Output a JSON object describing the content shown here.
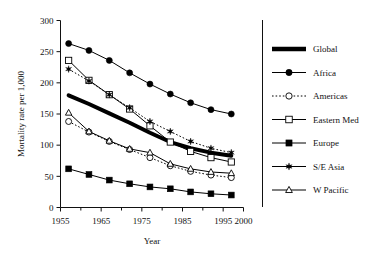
{
  "chart_data": {
    "type": "line",
    "title": "",
    "xlabel": "Year",
    "ylabel": "Mortality rate per 1,000",
    "xlim": [
      1955,
      2000
    ],
    "ylim": [
      0,
      300
    ],
    "xticks": [
      1955,
      1965,
      1975,
      1985,
      1995,
      2000
    ],
    "xtick_labels": [
      "1955",
      "1965",
      "1975",
      "1985",
      "1995",
      "2000"
    ],
    "xminorticks": [
      1960,
      1970,
      1980,
      1990
    ],
    "yticks": [
      0,
      50,
      100,
      150,
      200,
      250,
      300
    ],
    "ytick_labels": [
      "0",
      "50",
      "100",
      "150",
      "200",
      "250",
      "300"
    ],
    "grid": false,
    "legend_position": "right",
    "x": [
      1957,
      1962,
      1967,
      1972,
      1977,
      1982,
      1987,
      1992,
      1997
    ],
    "series": [
      {
        "name": "Global",
        "marker": "none",
        "linestyle": "solid",
        "linewidth": 4,
        "color": "#000000",
        "values": [
          180,
          166,
          151,
          136,
          120,
          105,
          95,
          88,
          83
        ]
      },
      {
        "name": "Africa",
        "marker": "filled-circle",
        "linestyle": "solid",
        "linewidth": 1,
        "color": "#000000",
        "values": [
          263,
          252,
          236,
          216,
          198,
          182,
          168,
          157,
          150
        ]
      },
      {
        "name": "Americas",
        "marker": "open-circle",
        "linestyle": "dotted",
        "linewidth": 1,
        "color": "#000000",
        "values": [
          138,
          121,
          106,
          93,
          80,
          67,
          58,
          52,
          48
        ]
      },
      {
        "name": "Eastern Med",
        "marker": "open-square",
        "linestyle": "solid",
        "linewidth": 1,
        "color": "#000000",
        "values": [
          236,
          204,
          181,
          158,
          131,
          105,
          90,
          80,
          73
        ]
      },
      {
        "name": "Europe",
        "marker": "filled-square",
        "linestyle": "solid",
        "linewidth": 1,
        "color": "#000000",
        "values": [
          62,
          53,
          44,
          38,
          33,
          30,
          25,
          22,
          20
        ]
      },
      {
        "name": "S/E Asia",
        "marker": "star",
        "linestyle": "dotted",
        "linewidth": 1,
        "color": "#000000",
        "values": [
          222,
          203,
          181,
          160,
          138,
          122,
          106,
          95,
          88
        ]
      },
      {
        "name": "W Pacific",
        "marker": "open-triangle",
        "linestyle": "solid",
        "linewidth": 1,
        "color": "#000000",
        "values": [
          152,
          122,
          107,
          94,
          88,
          70,
          62,
          57,
          55
        ]
      }
    ]
  },
  "legend": {
    "entries": [
      {
        "label": "Global",
        "marker": "none",
        "linestyle": "thick"
      },
      {
        "label": "Africa",
        "marker": "filled-circle",
        "linestyle": "solid"
      },
      {
        "label": "Americas",
        "marker": "open-circle",
        "linestyle": "dotted"
      },
      {
        "label": "Eastern Med",
        "marker": "open-square",
        "linestyle": "solid"
      },
      {
        "label": "Europe",
        "marker": "filled-square",
        "linestyle": "solid"
      },
      {
        "label": "S/E Asia",
        "marker": "star",
        "linestyle": "solid"
      },
      {
        "label": "W Pacific",
        "marker": "open-triangle",
        "linestyle": "solid"
      }
    ]
  }
}
